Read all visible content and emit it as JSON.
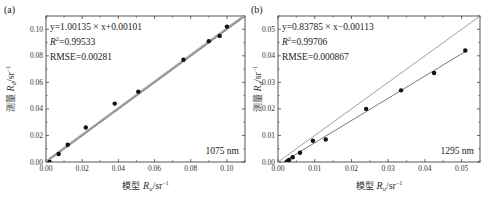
{
  "chart_data": [
    {
      "panel": "(a)",
      "type": "scatter",
      "wavelength_label": "1075 nm",
      "xlabel": "模型 Rₘ/sr⁻¹",
      "ylabel": "测量 R_d/sr⁻¹",
      "xlim": [
        0,
        0.11
      ],
      "ylim": [
        0,
        0.11
      ],
      "xticks": [
        "0.00",
        "0.02",
        "0.04",
        "0.06",
        "0.08",
        "0.10"
      ],
      "yticks": [
        "0.00",
        "0.02",
        "0.04",
        "0.06",
        "0.08",
        "0.10"
      ],
      "fit_equation": "y=1.00135 × x+0.00101",
      "r2": "R²=0.99533",
      "rmse": "RMSE=0.00281",
      "fit": {
        "slope": 1.00135,
        "intercept": 0.00101
      },
      "show_1to1_line": true,
      "points": [
        {
          "x": 0.002,
          "y": 0.0
        },
        {
          "x": 0.007,
          "y": 0.006
        },
        {
          "x": 0.012,
          "y": 0.013
        },
        {
          "x": 0.022,
          "y": 0.026
        },
        {
          "x": 0.038,
          "y": 0.044
        },
        {
          "x": 0.051,
          "y": 0.053
        },
        {
          "x": 0.076,
          "y": 0.077
        },
        {
          "x": 0.09,
          "y": 0.091
        },
        {
          "x": 0.096,
          "y": 0.095
        },
        {
          "x": 0.1,
          "y": 0.102
        }
      ]
    },
    {
      "panel": "(b)",
      "type": "scatter",
      "wavelength_label": "1295 nm",
      "xlabel": "模型 Rₘ/sr⁻¹",
      "ylabel": "测量 R_d/sr⁻¹",
      "xlim": [
        0,
        0.055
      ],
      "ylim": [
        0,
        0.055
      ],
      "xticks": [
        "0.00",
        "0.01",
        "0.02",
        "0.03",
        "0.04",
        "0.05"
      ],
      "yticks": [
        "0.00",
        "0.01",
        "0.02",
        "0.03",
        "0.04",
        "0.05"
      ],
      "fit_equation": "y=0.83785 × x−0.00113",
      "r2": "R²=0.99706",
      "rmse": "RMSE=0.000867",
      "fit": {
        "slope": 0.83785,
        "intercept": -0.00113
      },
      "show_1to1_line": true,
      "points": [
        {
          "x": 0.0025,
          "y": 0.0002
        },
        {
          "x": 0.003,
          "y": 0.0008
        },
        {
          "x": 0.004,
          "y": 0.0018
        },
        {
          "x": 0.006,
          "y": 0.0035
        },
        {
          "x": 0.0095,
          "y": 0.008
        },
        {
          "x": 0.013,
          "y": 0.0085
        },
        {
          "x": 0.024,
          "y": 0.02
        },
        {
          "x": 0.0335,
          "y": 0.027
        },
        {
          "x": 0.0425,
          "y": 0.0335
        },
        {
          "x": 0.051,
          "y": 0.042
        }
      ]
    }
  ],
  "panels": [
    {
      "tag": "(a)",
      "eq": "y=1.00135 × x+0.00101",
      "r2_label": "R",
      "r2_value": "=0.99533",
      "rmse": "RMSE=0.00281",
      "wl": "1075 nm",
      "ylabel_cn": "测量",
      "xlabel_cn": "模型"
    },
    {
      "tag": "(b)",
      "eq": "y=0.83785 × x−0.00113",
      "r2_label": "R",
      "r2_value": "=0.99706",
      "rmse": "RMSE=0.000867",
      "wl": "1295 nm",
      "ylabel_cn": "测量",
      "xlabel_cn": "模型"
    }
  ]
}
